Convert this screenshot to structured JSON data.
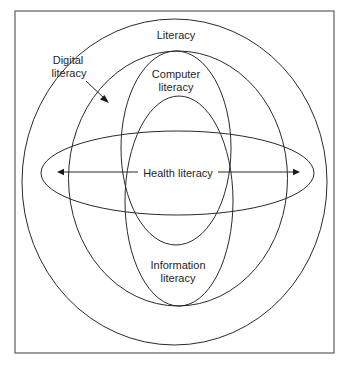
{
  "diagram": {
    "type": "nested-ellipse-venn",
    "frame": {
      "x": 15,
      "y": 11,
      "width": 319,
      "height": 342
    },
    "colors": {
      "stroke": "#2a2a2a",
      "text": "#1f1f1f",
      "frame": "#6a6a6a",
      "background": "#ffffff"
    },
    "sets": [
      {
        "id": "literacy",
        "label": "Literacy",
        "cx": 174.5,
        "cy": 182,
        "rx": 152.5,
        "ry": 163
      },
      {
        "id": "digital-literacy",
        "label_lines": [
          "Digital",
          "literacy"
        ],
        "cx": 178,
        "cy": 178.5,
        "rx": 109.5,
        "ry": 127.5
      },
      {
        "id": "computer-literacy",
        "label_lines": [
          "Computer",
          "literacy"
        ],
        "cx": 176,
        "cy": 148,
        "rx": 55,
        "ry": 97
      },
      {
        "id": "information-literacy",
        "label_lines": [
          "Information",
          "literacy"
        ],
        "cx": 179,
        "cy": 201,
        "rx": 54,
        "ry": 105
      },
      {
        "id": "health-literacy",
        "label": "Health literacy",
        "cx": 177.5,
        "cy": 173,
        "rx": 136.5,
        "ry": 42
      }
    ],
    "labels": {
      "literacy": "Literacy",
      "digital_line1": "Digital",
      "digital_line2": "literacy",
      "computer_line1": "Computer",
      "computer_line2": "literacy",
      "information_line1": "Information",
      "information_line2": "literacy",
      "health": "Health literacy"
    },
    "arrows": [
      {
        "id": "digital-pointer",
        "from": [
          86,
          81
        ],
        "to": [
          108,
          102
        ]
      },
      {
        "id": "health-left",
        "from": [
          138,
          172
        ],
        "to": [
          58,
          172
        ]
      },
      {
        "id": "health-right",
        "from": [
          218,
          172
        ],
        "to": [
          299,
          172
        ]
      }
    ]
  }
}
